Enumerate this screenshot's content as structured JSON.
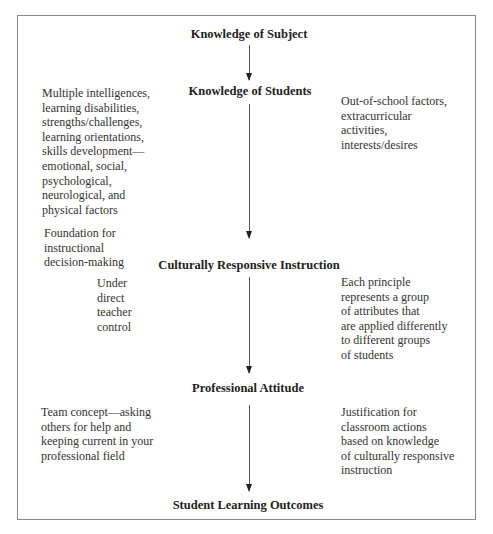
{
  "diagram": {
    "nodes": [
      {
        "id": "subject",
        "label": "Knowledge of Subject"
      },
      {
        "id": "students",
        "label": "Knowledge of Students"
      },
      {
        "id": "instruction",
        "label": "Culturally Responsive Instruction"
      },
      {
        "id": "attitude",
        "label": "Professional Attitude"
      },
      {
        "id": "outcomes",
        "label": "Student Learning Outcomes"
      }
    ],
    "edges": [
      {
        "from": "subject",
        "to": "students"
      },
      {
        "from": "students",
        "to": "instruction"
      },
      {
        "from": "instruction",
        "to": "attitude"
      },
      {
        "from": "attitude",
        "to": "outcomes"
      }
    ],
    "notes": {
      "students_left": [
        "Multiple intelligences,",
        "learning disabilities,",
        "strengths/challenges,",
        "learning orientations,",
        "skills development—",
        "emotional, social,",
        "psychological,",
        "neurological, and",
        "physical factors"
      ],
      "students_right": [
        "Out-of-school factors,",
        "extracurricular",
        "activities,",
        "interests/desires"
      ],
      "foundation": [
        "Foundation for",
        "instructional",
        "decision-making"
      ],
      "instruction_left": [
        "Under",
        "direct",
        "teacher",
        "control"
      ],
      "instruction_right": [
        "Each principle",
        "represents a group",
        "of attributes that",
        "are applied differently",
        "to different groups",
        "of students"
      ],
      "attitude_left": [
        "Team concept—asking",
        "others for help and",
        "keeping current in your",
        "professional field"
      ],
      "attitude_right": [
        "Justification for",
        "classroom actions",
        "based on knowledge",
        "of culturally responsive",
        "instruction"
      ]
    }
  }
}
